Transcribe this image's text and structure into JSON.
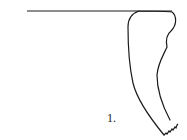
{
  "figure": {
    "label": "1.",
    "stroke_color": "#1a1a1a",
    "background": "#ffffff",
    "rim_line": {
      "x1": 27,
      "y1": 11,
      "x2": 172,
      "y2": 11
    }
  }
}
